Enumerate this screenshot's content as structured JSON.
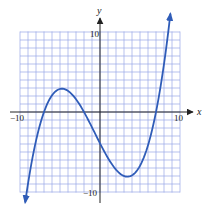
{
  "chart_data": {
    "type": "line",
    "title": "",
    "xlabel": "x",
    "ylabel": "y",
    "xlim": [
      -10,
      10
    ],
    "ylim": [
      -10,
      10
    ],
    "grid": true,
    "grid_step": 1,
    "tick_labels": {
      "x": [
        {
          "value": -10,
          "label": "−10"
        },
        {
          "value": 10,
          "label": "10"
        }
      ],
      "y": [
        {
          "value": 10,
          "label": "10"
        },
        {
          "value": -10,
          "label": "−10"
        }
      ]
    },
    "series": [
      {
        "name": "f(x) = 0.04(x+7)(x+2)(x−7)",
        "description": "cubic with roots at x=−7, −2, 7; local max ≈ (−4.8, 2.9); local min ≈ (3.4, −8.1); arrows at both ends",
        "roots": [
          -7,
          -2,
          7
        ],
        "local_max": [
          -4.8,
          2.9
        ],
        "local_min": [
          3.4,
          -8.1
        ],
        "y_intercept": -3.9,
        "x_range": [
          -9.35,
          8.8
        ],
        "x": [
          -9.35,
          -9,
          -8,
          -7,
          -6,
          -5,
          -4,
          -3,
          -2,
          -1,
          0,
          1,
          2,
          3,
          4,
          5,
          6,
          7,
          8,
          8.8
        ],
        "y": [
          -11.4,
          -8.9,
          -3.6,
          0,
          2.2,
          2.9,
          2.6,
          1.6,
          0,
          -1.9,
          -3.9,
          -5.8,
          -7.2,
          -8.0,
          -7.9,
          -6.7,
          -4.2,
          0,
          5.0,
          12.1
        ]
      }
    ],
    "colors": {
      "curve": "#2f5cb8",
      "grid": "#9aa6e6",
      "axis": "#222222"
    },
    "legend": null
  }
}
